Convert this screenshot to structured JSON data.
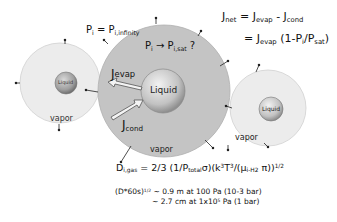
{
  "diagram": {
    "droplets": [
      {
        "id": "left",
        "liquid_label": "Liquid",
        "vapor_label": "vapor"
      },
      {
        "id": "center",
        "liquid_label": "Liquid",
        "vapor_label": "vapor"
      },
      {
        "id": "right",
        "liquid_label": "Liquid",
        "vapor_label": "vapor"
      }
    ],
    "labels": {
      "p_eq_main": "P",
      "p_eq_sub": "i",
      "p_eq_mid": " = P",
      "p_eq_sub2": "i,infinity",
      "p_arrow_main": "P",
      "p_arrow_sub": "i",
      "p_arrow_mid": " → P",
      "p_arrow_sub2": "i,sat",
      "p_arrow_end": " ?",
      "j_evap_main": "J",
      "j_evap_sub": "evap",
      "j_cond_main": "J",
      "j_cond_sub": "cond"
    },
    "equations": {
      "jnet_line1": {
        "a": "J",
        "a_sub": "net",
        "b": " = J",
        "b_sub": "evap",
        "c": " - J",
        "c_sub": "cond"
      },
      "jnet_line2": {
        "a": "= J",
        "a_sub": "evap",
        "b": " (1-P",
        "b_sub": "i",
        "c": "/P",
        "c_sub": "sat",
        "d": ")"
      },
      "diffusion": {
        "a": "D",
        "a_sub": "i,gas",
        "b": " = 2/3 (1/P",
        "b_sub": "total",
        "c": "σ)(k",
        "c_sup": "3",
        "d": "T",
        "d_sup": "3",
        "e": "/(μ",
        "e_sub": "i-H2",
        "f": " π))",
        "f_sup": "1/2"
      },
      "length_line1": {
        "a": "(D*60s)",
        "a_sup": "1/2",
        "b": " ~ 0.9   m at 100 Pa (10-3 bar)"
      },
      "length_line2": {
        "a": "~ 2.7 cm at 1x10",
        "a_sup": "5",
        "b": " Pa (1 bar)"
      }
    },
    "colors": {
      "outer_light": "#e6e6e6",
      "outer_dark": "#bdbdbd",
      "liquid_core": "#c8c8c8",
      "arrow_stroke": "#444444"
    }
  }
}
